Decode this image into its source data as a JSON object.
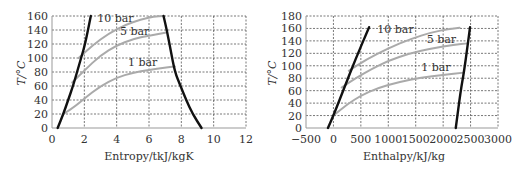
{
  "chart_data": [
    {
      "type": "line",
      "title": "",
      "xlabel": "Entropy/tkJ/kgK",
      "ylabel": "T/°C",
      "xlim": [
        0,
        12
      ],
      "ylim": [
        0,
        160
      ],
      "xticks": [
        0,
        2,
        4,
        6,
        8,
        10,
        12
      ],
      "yticks": [
        0,
        20,
        40,
        60,
        80,
        100,
        120,
        140,
        160
      ],
      "grid": true,
      "legend": "none",
      "series": [
        {
          "name": "saturated liquid",
          "color": "#111111",
          "x": [
            0.35,
            0.7,
            1.0,
            1.3,
            1.55,
            1.8,
            2.05,
            2.4
          ],
          "y": [
            0,
            20,
            40,
            60,
            80,
            100,
            120,
            160
          ]
        },
        {
          "name": "saturated vapour",
          "color": "#111111",
          "x": [
            6.9,
            7.1,
            7.35,
            7.6,
            7.95,
            8.3,
            8.7,
            9.25
          ],
          "y": [
            160,
            140,
            110,
            80,
            60,
            40,
            20,
            0
          ]
        },
        {
          "name": "1 bar",
          "color": "#aaaaaa",
          "x": [
            0.7,
            1.5,
            2.0,
            3.0,
            4.0,
            5.0,
            6.0,
            7.0,
            7.6
          ],
          "y": [
            20,
            32,
            42,
            60,
            72,
            79,
            83,
            86,
            88
          ]
        },
        {
          "name": "5 bar",
          "color": "#aaaaaa",
          "x": [
            1.25,
            2.0,
            3.0,
            4.0,
            5.0,
            6.0,
            7.0
          ],
          "y": [
            65,
            82,
            104,
            118,
            127,
            132,
            136
          ]
        },
        {
          "name": "10 bar",
          "color": "#aaaaaa",
          "x": [
            1.65,
            2.5,
            3.5,
            4.5,
            5.5,
            6.3,
            6.9
          ],
          "y": [
            100,
            118,
            135,
            147,
            155,
            159,
            160
          ]
        }
      ],
      "annotations": [
        {
          "text": "10 bar",
          "x": 2.8,
          "y": 151
        },
        {
          "text": "5 bar",
          "x": 4.2,
          "y": 133
        },
        {
          "text": "1 bar",
          "x": 4.7,
          "y": 88
        }
      ]
    },
    {
      "type": "line",
      "title": "",
      "xlabel": "Enthalpy/kJ/kg",
      "ylabel": "T/°C",
      "xlim": [
        -500,
        3000
      ],
      "ylim": [
        0,
        180
      ],
      "xticks": [
        -500,
        0,
        500,
        1000,
        1500,
        2000,
        2500,
        3000
      ],
      "yticks": [
        0,
        20,
        40,
        60,
        80,
        100,
        120,
        140,
        160,
        180
      ],
      "grid": true,
      "legend": "none",
      "series": [
        {
          "name": "saturated liquid",
          "color": "#111111",
          "x": [
            -100,
            0,
            200,
            400,
            650
          ],
          "y": [
            0,
            20,
            65,
            110,
            162
          ]
        },
        {
          "name": "saturated vapour",
          "color": "#111111",
          "x": [
            2230,
            2320,
            2380,
            2450,
            2490
          ],
          "y": [
            0,
            60,
            90,
            135,
            162
          ]
        },
        {
          "name": "1 bar",
          "color": "#aaaaaa",
          "x": [
            0,
            250,
            500,
            800,
            1200,
            1600,
            2000,
            2380
          ],
          "y": [
            20,
            38,
            52,
            64,
            74,
            81,
            85,
            89
          ]
        },
        {
          "name": "5 bar",
          "color": "#aaaaaa",
          "x": [
            150,
            400,
            700,
            1000,
            1400,
            1800,
            2200,
            2450
          ],
          "y": [
            65,
            80,
            95,
            108,
            120,
            128,
            134,
            136
          ]
        },
        {
          "name": "10 bar",
          "color": "#aaaaaa",
          "x": [
            280,
            600,
            1000,
            1400,
            1800,
            2100,
            2300
          ],
          "y": [
            92,
            110,
            128,
            143,
            154,
            159,
            161
          ]
        }
      ],
      "annotations": [
        {
          "text": "10 bar",
          "x": 800,
          "y": 152
        },
        {
          "text": "5 bar",
          "x": 1700,
          "y": 137
        },
        {
          "text": "1 bar",
          "x": 1600,
          "y": 92
        }
      ]
    }
  ]
}
